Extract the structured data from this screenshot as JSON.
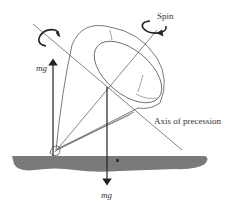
{
  "diagram": {
    "labels": {
      "spin": "Spin",
      "axis_of_precession": "Axis of precession",
      "mg_upward": "mg",
      "mg_downward": "mg"
    },
    "colors": {
      "line": "#555555",
      "arrow": "#222222",
      "ground": "#7a7a7a",
      "outline": "#6a6a6a"
    }
  }
}
